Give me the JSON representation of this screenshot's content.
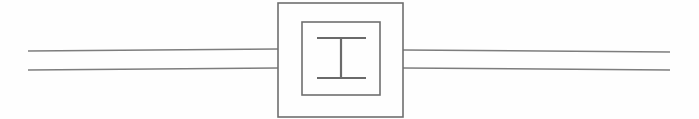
{
  "figure": {
    "title": "Two-conductor transmission line with inline I-beam component",
    "background_color": "#fefefe",
    "width": 699,
    "height": 119
  },
  "palette": {
    "line_gray": "#7d7d7d",
    "rect_gray": "#6f6f6f",
    "glyph_gray": "#6a6a6a",
    "background": "#fefefe"
  },
  "chart_data": {
    "type": "line",
    "title": "Two-conductor transmission line with inline I-beam component",
    "xlabel": "",
    "ylabel": "",
    "xlim": [
      0,
      699
    ],
    "ylim": [
      0,
      119
    ],
    "grid": false,
    "legend_position": "none",
    "series": [
      {
        "name": "left-upper-conductor",
        "x": [
          28,
          278
        ],
        "y": [
          51,
          49
        ]
      },
      {
        "name": "left-lower-conductor",
        "x": [
          28,
          278
        ],
        "y": [
          70,
          68
        ]
      },
      {
        "name": "right-upper-conductor",
        "x": [
          403,
          670
        ],
        "y": [
          50,
          52
        ]
      },
      {
        "name": "right-lower-conductor",
        "x": [
          403,
          670
        ],
        "y": [
          68,
          70
        ]
      }
    ],
    "annotations": [
      {
        "name": "outer-component-rect",
        "shape": "rect",
        "x": 278,
        "y": 3,
        "width": 125,
        "height": 114
      },
      {
        "name": "inner-component-rect",
        "shape": "rect",
        "x": 302,
        "y": 22,
        "width": 78,
        "height": 73
      },
      {
        "name": "ibeam-top-flange",
        "shape": "line",
        "x1": 317,
        "y1": 38,
        "x2": 366,
        "y2": 38
      },
      {
        "name": "ibeam-bottom-flange",
        "shape": "line",
        "x1": 317,
        "y1": 78,
        "x2": 366,
        "y2": 78
      },
      {
        "name": "ibeam-web-stem",
        "shape": "line",
        "x1": 341,
        "y1": 38,
        "x2": 341,
        "y2": 78
      }
    ]
  },
  "labels": {
    "figure_caption": "Two-conductor transmission line with inline I-beam component",
    "component_name": "I-beam symbol",
    "left_port_name": "left conductor pair",
    "right_port_name": "right conductor pair"
  }
}
